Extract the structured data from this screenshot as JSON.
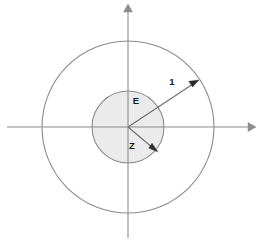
{
  "figure": {
    "type": "annulus-diagram",
    "background_color": "#ffffff",
    "width": 260,
    "height": 245,
    "origin": {
      "x": 128,
      "y": 127
    }
  },
  "axes": {
    "x_axis": {
      "name": "horizontal-axis",
      "from_x": 7,
      "to_x": 250,
      "y": 127,
      "arrow": "right",
      "color": "#8c8c8c",
      "tick_labels": []
    },
    "y_axis": {
      "name": "vertical-axis",
      "x": 128,
      "from_y": 238,
      "to_y": 10,
      "arrow": "up",
      "color": "#8c8c8c",
      "tick_labels": []
    }
  },
  "shapes": {
    "outer_circle": {
      "label": "",
      "cx": 128,
      "cy": 127,
      "r": 86,
      "fill": "none",
      "stroke": "#8a8a8a"
    },
    "inner_circle": {
      "label": "Z",
      "cx": 128,
      "cy": 127,
      "r": 36,
      "fill": "#ebebeb",
      "stroke": "#8a8a8a"
    }
  },
  "annotations": [
    {
      "id": "outer-radius",
      "label": "1",
      "label_x": 172,
      "label_y": 82,
      "from_x": 128,
      "from_y": 127,
      "to_x": 196,
      "to_y": 82,
      "arrow": true,
      "color": "#2b2b2b"
    },
    {
      "id": "inner-radius",
      "label": "Z",
      "label_x": 132,
      "label_y": 146,
      "from_x": 128,
      "from_y": 127,
      "to_x": 155,
      "to_y": 150,
      "arrow": true,
      "color": "#2b2b2b"
    },
    {
      "id": "region-label",
      "label": "E",
      "label_x": 136,
      "label_y": 101,
      "arrow": false,
      "color": "#1a1a1a"
    }
  ]
}
